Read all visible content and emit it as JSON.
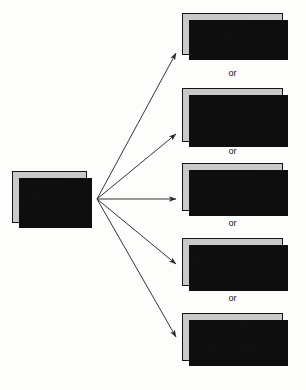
{
  "diagram": {
    "type": "flowchart-fan-out",
    "background_color": "#fdfdfc",
    "node_fill_color": "#c9c9c9",
    "node_border_color": "#151515",
    "shadow_color": "#0e0e0e",
    "connector_color": "#2a2a2a",
    "source": {
      "id": "minors-disaffirm",
      "lines": [
        "Minors can",
        "disaffirm",
        "a contract"
      ],
      "emphasis_line": "unless:",
      "emphasis_style": "italic"
    },
    "separator_label": "or",
    "separators": [
      {
        "label": "or"
      },
      {
        "label": "or"
      },
      {
        "label": "or"
      },
      {
        "label": "or"
      }
    ],
    "conditions": [
      {
        "id": "necessaries",
        "text": "Contract is for\nnecessaries"
      },
      {
        "id": "real-estate-minority",
        "text": "Contract is for\nreal estate and\nminor has not\nreached majority"
      },
      {
        "id": "return-status-quo",
        "text": "Minor is required\nto return adult\nto status quo first"
      },
      {
        "id": "lied-about-age",
        "text": "Minor has lied\nabout age (in\nmost states)"
      },
      {
        "id": "ratified-on-majority",
        "text": "Minor has ratified\ncontract on\nreaching majority"
      }
    ]
  }
}
